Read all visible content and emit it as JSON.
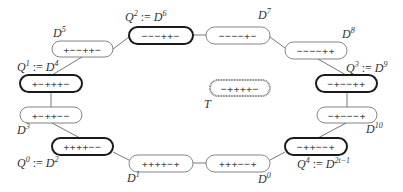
{
  "diagram": {
    "title": "",
    "nodes": [
      {
        "id": "D0",
        "signs": "+++−−+",
        "label": "D",
        "sup": "0",
        "q": null,
        "highlight": false
      },
      {
        "id": "D1",
        "signs": "++++−+",
        "label": "D",
        "sup": "1",
        "q": null,
        "highlight": false
      },
      {
        "id": "D2",
        "signs": "++++−−",
        "label": "D",
        "sup": "2",
        "q": "Q",
        "qsup": "0",
        "highlight": true
      },
      {
        "id": "D3",
        "signs": "+−++−−",
        "label": "D",
        "sup": "3",
        "q": null,
        "highlight": false
      },
      {
        "id": "D4",
        "signs": "+−+++−",
        "label": "D",
        "sup": "4",
        "q": "Q",
        "qsup": "1",
        "highlight": true
      },
      {
        "id": "D5",
        "signs": "+−−++−",
        "label": "D",
        "sup": "5",
        "q": null,
        "highlight": false
      },
      {
        "id": "D6",
        "signs": "−−−++−",
        "label": "D",
        "sup": "6",
        "q": "Q",
        "qsup": "2",
        "highlight": true
      },
      {
        "id": "D7",
        "signs": "−−−−+−",
        "label": "D",
        "sup": "7",
        "q": null,
        "highlight": false
      },
      {
        "id": "D8",
        "signs": "−−−−++",
        "label": "D",
        "sup": "8",
        "q": null,
        "highlight": false
      },
      {
        "id": "D9",
        "signs": "−+−−++",
        "label": "D",
        "sup": "9",
        "q": "Q",
        "qsup": "3",
        "highlight": true
      },
      {
        "id": "D10",
        "signs": "−+−−−+",
        "label": "D",
        "sup": "10",
        "q": null,
        "highlight": false
      },
      {
        "id": "D2t-1",
        "signs": "−++−−+",
        "label": "D",
        "sup": "2t−1",
        "q": "Q",
        "qsup": "4",
        "highlight": true
      }
    ],
    "target": {
      "id": "T",
      "signs": "−++++−",
      "label": "T"
    },
    "assign_op": ":=",
    "colors": {
      "edge": "#555555",
      "normal_border": "#666666",
      "highlight_border": "#1a1a1a",
      "target_border": "#888888",
      "text": "#333333"
    }
  }
}
